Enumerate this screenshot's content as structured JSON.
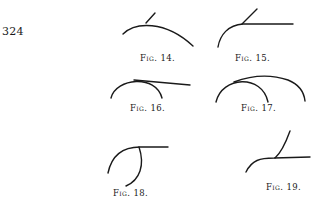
{
  "page": {
    "number": "324"
  },
  "figures": [
    {
      "id": "fig14",
      "label": "Fig. 14."
    },
    {
      "id": "fig15",
      "label": "Fig. 15."
    },
    {
      "id": "fig16",
      "label": "Fig. 16."
    },
    {
      "id": "fig17",
      "label": "Fig. 17."
    },
    {
      "id": "fig18",
      "label": "Fig. 18."
    },
    {
      "id": "fig19",
      "label": "Fig. 19."
    }
  ],
  "colors": {
    "ink": "#1a1a1a",
    "paper": "#ffffff"
  }
}
